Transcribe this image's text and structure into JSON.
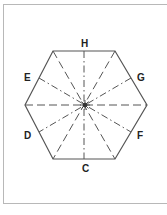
{
  "diagram": {
    "labels": {
      "top": "H",
      "bottom": "C",
      "upper_left": "E",
      "upper_right": "G",
      "lower_left": "D",
      "lower_right": "F"
    },
    "colors": {
      "stroke": "#555555",
      "frame": "#b8b8b8",
      "background": "#ffffff"
    }
  }
}
